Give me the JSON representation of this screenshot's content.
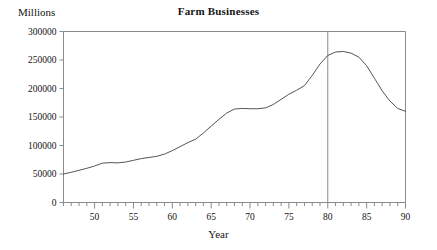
{
  "chart_data": {
    "type": "line",
    "title": "Farm Businesses",
    "xlabel": "Year",
    "ylabel": "Millions",
    "grid": false,
    "legend": "none",
    "xlim": [
      46,
      90
    ],
    "ylim": [
      0,
      300000
    ],
    "y_ticks": [
      0,
      50000,
      100000,
      150000,
      200000,
      250000,
      300000
    ],
    "y_tick_labels": [
      "0",
      "50000",
      "100000",
      "150000",
      "200000",
      "250000",
      "300000"
    ],
    "x_ticks": [
      50,
      55,
      60,
      65,
      70,
      75,
      80,
      85,
      90
    ],
    "x_tick_labels": [
      "50",
      "55",
      "60",
      "65",
      "70",
      "75",
      "80",
      "85",
      "90"
    ],
    "x_minor_tick_step": 1,
    "annotations": [
      {
        "type": "vertical-line",
        "x": 80,
        "label": ""
      }
    ],
    "series": [
      {
        "name": "Farm Businesses",
        "color": "#555555",
        "x": [
          46,
          47,
          48,
          49,
          50,
          51,
          52,
          53,
          54,
          55,
          56,
          57,
          58,
          59,
          60,
          61,
          62,
          63,
          64,
          65,
          66,
          67,
          68,
          69,
          70,
          71,
          72,
          73,
          74,
          75,
          76,
          77,
          78,
          79,
          80,
          81,
          82,
          83,
          84,
          85,
          86,
          87,
          88,
          89,
          90
        ],
        "values": [
          50000,
          53000,
          56500,
          60000,
          64000,
          69000,
          70000,
          69500,
          71000,
          74000,
          77000,
          79000,
          81000,
          85000,
          91000,
          98000,
          105000,
          111000,
          122000,
          134000,
          146000,
          157000,
          164000,
          165000,
          164500,
          164500,
          166000,
          172000,
          181000,
          190000,
          197000,
          205000,
          223000,
          243000,
          258000,
          264000,
          265000,
          262000,
          255000,
          240000,
          218000,
          196000,
          178000,
          165000,
          160000
        ]
      }
    ]
  },
  "axis": {
    "y_label_text": "Millions",
    "x_label_text": "Year"
  }
}
